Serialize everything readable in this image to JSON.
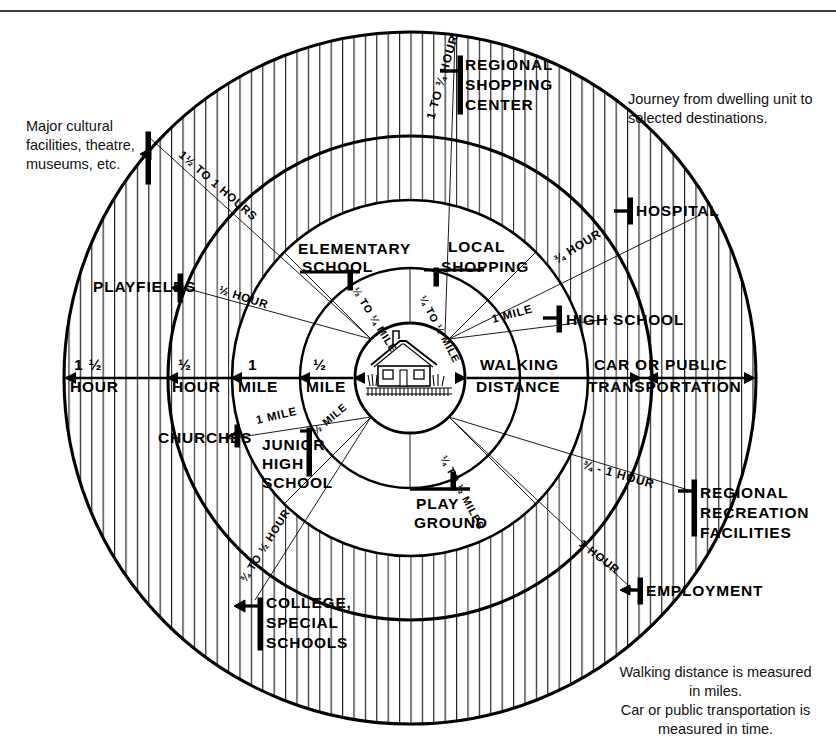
{
  "figure": {
    "title_note": "Journey from dwelling unit to\nselected destinations.",
    "footer_note_line1": "Walking distance is measured",
    "footer_note_line2": "in miles.",
    "footer_note_line3": "Car or public transportation is",
    "footer_note_line4": "measured in time.",
    "left_note": "Major cultural\nfacilities, theatre,\nmuseums, etc.",
    "center_icon": "dwelling-unit-house"
  },
  "chart_data": {
    "type": "diagram",
    "center": "dwelling unit",
    "rings": [
      {
        "index": 1,
        "label_top": "½",
        "label_bottom": "MILE",
        "unit": "mile",
        "hatched": false
      },
      {
        "index": 2,
        "label_top": "1",
        "label_bottom": "MILE",
        "unit": "mile",
        "hatched": false
      },
      {
        "index": 3,
        "label_top": "½",
        "label_bottom": "HOUR",
        "unit": "hour",
        "hatched": true
      },
      {
        "index": 4,
        "label_top": "1 ½",
        "label_bottom": "HOUR",
        "unit": "hour",
        "hatched": true
      }
    ],
    "axis_bands": [
      {
        "line1": "WALKING",
        "line2": "DISTANCE"
      },
      {
        "line1": "CAR  OR  PUBLIC",
        "line2": "TRANSPORTATION"
      }
    ],
    "destinations": [
      {
        "name": "ELEMENTARY\nSCHOOL",
        "travel": "½ TO ¼ MILE"
      },
      {
        "name": "LOCAL\nSHOPPING",
        "travel": "¼ TO ½ MILE"
      },
      {
        "name": "PLAY\nGROUND",
        "travel": "¼ TO ½ MILES"
      },
      {
        "name": "JUNIOR\nHIGH\nSCHOOL",
        "travel": "½ MILE"
      },
      {
        "name": "CHURCHES",
        "travel": "1 MILE"
      },
      {
        "name": "HIGH SCHOOL",
        "travel": "1 MILE"
      },
      {
        "name": "PLAYFIELDS",
        "travel": "½ HOUR"
      },
      {
        "name": "HOSPITAL",
        "travel": "¾ HOUR"
      },
      {
        "name": "REGIONAL\nSHOPPING\nCENTER",
        "travel": "1 TO ¾ HOUR"
      },
      {
        "name": "COLLEGE,\nSPECIAL\nSCHOOLS",
        "travel": "¾ TO ½ HOUR"
      },
      {
        "name": "REGIONAL\nRECREATION\nFACILITIES",
        "travel": "¾ - 1 HOUR"
      },
      {
        "name": "EMPLOYMENT",
        "travel": "1 HOUR"
      },
      {
        "name": "Major cultural facilities, theatre, museums, etc.",
        "travel": "1½ TO 1 HOURS"
      }
    ]
  },
  "axis": {
    "left": [
      {
        "top": "1 ½",
        "bottom": "HOUR"
      },
      {
        "top": "½",
        "bottom": "HOUR"
      },
      {
        "top": "1",
        "bottom": "MILE"
      },
      {
        "top": "½",
        "bottom": "MILE"
      }
    ],
    "right": [
      {
        "top": "WALKING",
        "bottom": "DISTANCE"
      },
      {
        "top": "CAR  OR  PUBLIC",
        "bottom": "TRANSPORTATION"
      }
    ]
  },
  "labels": {
    "regional_shopping_center": "REGIONAL\nSHOPPING\nCENTER",
    "regional_shopping_center_travel": "1 TO ¾ HOUR",
    "hospital": "HOSPITAL",
    "hospital_travel": "¾ HOUR",
    "high_school": "HIGH SCHOOL",
    "high_school_travel": "1 MILE",
    "local_shopping": "LOCAL\nSHOPPING",
    "local_shopping_travel": "¼ TO ½ MILE",
    "elementary_school": "ELEMENTARY\nSCHOOL",
    "elementary_school_travel": "½ TO ¼ MILE",
    "playfields": "PLAYFIELDS",
    "playfields_travel": "½ HOUR",
    "cultural_travel": "1½ TO 1 HOURS",
    "churches": "CHURCHES",
    "churches_travel": "1 MILE",
    "junior_high_school": "JUNIOR\nHIGH\nSCHOOL",
    "junior_high_school_travel": "½ MILE",
    "playground": "PLAY\nGROUND",
    "playground_travel": "¼ TO ½ MILES",
    "college_special_schools": "COLLEGE,\nSPECIAL\nSCHOOLS",
    "college_travel": "¾ TO ½ HOUR",
    "regional_recreation": "REGIONAL\nRECREATION\nFACILITIES",
    "regional_recreation_travel": "¾ - 1 HOUR",
    "employment": "EMPLOYMENT",
    "employment_travel": "1 HOUR"
  },
  "colors": {
    "ink": "#000000",
    "paper": "#ffffff",
    "hatch": "#2a2a2a"
  }
}
